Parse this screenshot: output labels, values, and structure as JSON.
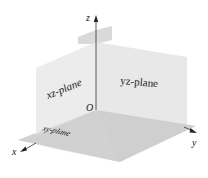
{
  "diagram": {
    "axes": {
      "x_label": "x",
      "y_label": "y",
      "z_label": "z",
      "origin_label": "O"
    },
    "planes": {
      "xz": "xz-plane",
      "yz": "yz-plane",
      "xy": "xy-plane"
    },
    "colors": {
      "plane_light": "#e6e6e6",
      "plane_floor": "#cdcdcd",
      "plane_back": "#d4d4d4",
      "axis": "#333333"
    }
  }
}
